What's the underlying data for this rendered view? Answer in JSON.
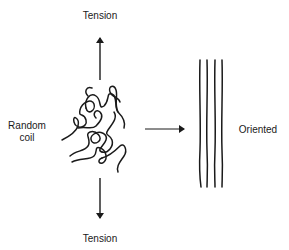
{
  "diagram": {
    "labels": {
      "tension_top": "Tension",
      "tension_bottom": "Tension",
      "random_coil_line1": "Random",
      "random_coil_line2": "coil",
      "oriented": "Oriented"
    },
    "elements": {
      "coil": "random-coil-polymer-chain",
      "oriented_chains_count": 4,
      "arrows": [
        "tension-up-arrow",
        "tension-down-arrow",
        "transition-arrow"
      ]
    },
    "colors": {
      "ink": "#1a1a1a",
      "background": "#ffffff"
    }
  }
}
